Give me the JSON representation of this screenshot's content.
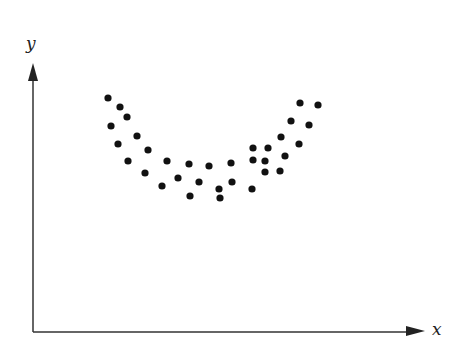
{
  "chart_data": {
    "type": "scatter",
    "title": "",
    "xlabel": "x",
    "ylabel": "y",
    "grid": false,
    "legend": null,
    "ticks": false,
    "origin_px": [
      33,
      332
    ],
    "points": [
      {
        "x": 75,
        "y": 234
      },
      {
        "x": 87,
        "y": 225
      },
      {
        "x": 78,
        "y": 206
      },
      {
        "x": 94,
        "y": 215
      },
      {
        "x": 85,
        "y": 188
      },
      {
        "x": 104,
        "y": 196
      },
      {
        "x": 95,
        "y": 171
      },
      {
        "x": 115,
        "y": 182
      },
      {
        "x": 112,
        "y": 159
      },
      {
        "x": 134,
        "y": 171
      },
      {
        "x": 129,
        "y": 146
      },
      {
        "x": 145,
        "y": 154
      },
      {
        "x": 156,
        "y": 168
      },
      {
        "x": 157,
        "y": 136
      },
      {
        "x": 166,
        "y": 150
      },
      {
        "x": 176,
        "y": 166
      },
      {
        "x": 187,
        "y": 134
      },
      {
        "x": 198,
        "y": 169
      },
      {
        "x": 186,
        "y": 143
      },
      {
        "x": 199,
        "y": 150
      },
      {
        "x": 219,
        "y": 143
      },
      {
        "x": 232,
        "y": 171
      },
      {
        "x": 220,
        "y": 172
      },
      {
        "x": 220,
        "y": 184
      },
      {
        "x": 232,
        "y": 160
      },
      {
        "x": 235,
        "y": 184
      },
      {
        "x": 247,
        "y": 161
      },
      {
        "x": 248,
        "y": 195
      },
      {
        "x": 252,
        "y": 176
      },
      {
        "x": 258,
        "y": 211
      },
      {
        "x": 266,
        "y": 188
      },
      {
        "x": 267,
        "y": 229
      },
      {
        "x": 276,
        "y": 207
      },
      {
        "x": 285,
        "y": 227
      }
    ],
    "xlim": [
      0,
      392
    ],
    "ylim": [
      0,
      270
    ]
  },
  "labels": {
    "x_axis": "x",
    "y_axis": "y"
  },
  "style": {
    "dot_color": "#111111",
    "axis_color": "#333333",
    "background": "#ffffff"
  }
}
